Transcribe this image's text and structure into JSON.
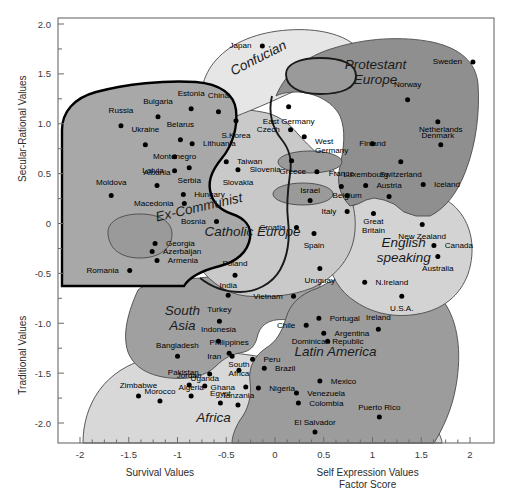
{
  "chart_data": {
    "type": "scatter",
    "title": "",
    "xlabel": "Survival Values / Self Expression Values Factor Score",
    "ylabel": "Traditional Values / Secular-Rational Values",
    "xlim": [
      -2.2,
      2.2
    ],
    "ylim": [
      -2.25,
      2.0
    ],
    "grid": false,
    "legend": "none",
    "axes": {
      "y_top_title": "Secular-Rational Values",
      "y_bottom_title": "Traditional Values",
      "x_left_title": "Survival Values",
      "x_right_title_line1": "Self Expression Values",
      "x_right_title_line2": "Factor Score",
      "x_ticks": [
        "-2",
        "-1.5",
        "-1",
        "-0.5",
        "0",
        "0.5",
        "1",
        "1.5",
        "2"
      ],
      "x_tick_values": [
        -2,
        -1.5,
        -1,
        -0.5,
        0,
        0.5,
        1,
        1.5,
        2
      ],
      "y_ticks": [
        "2.0",
        "1.5",
        "1.0",
        "0.5",
        "0",
        "-0.5",
        "-1.0",
        "-1.5",
        "-2.0"
      ],
      "y_tick_values": [
        2.0,
        1.5,
        1.0,
        0.5,
        0,
        -0.5,
        -1.0,
        -1.5,
        -2.0
      ]
    },
    "zone_labels": [
      {
        "name": "Confucian",
        "x": -0.15,
        "y": 1.62,
        "rotate": -27,
        "size": "lg"
      },
      {
        "name": "Protestant Europe",
        "x": 1.03,
        "y": 1.55,
        "size": "lg",
        "two_line": true
      },
      {
        "name": "Ex-Communist",
        "x": -0.77,
        "y": 0.12,
        "rotate": -13,
        "size": "lg"
      },
      {
        "name": "Catholic Europe",
        "x": -0.23,
        "y": -0.13,
        "size": "lg"
      },
      {
        "name": "English speaking",
        "x": 1.32,
        "y": -0.24,
        "size": "lg",
        "two_line": true
      },
      {
        "name": "South Asia",
        "x": -0.95,
        "y": -0.92,
        "size": "lg",
        "two_line": true
      },
      {
        "name": "Latin America",
        "x": 0.62,
        "y": -1.33,
        "size": "lg"
      },
      {
        "name": "Africa",
        "x": -0.63,
        "y": -1.99,
        "size": "lg"
      }
    ],
    "points": [
      {
        "label": "Japan",
        "x": -0.13,
        "y": 1.78,
        "lx": -0.2,
        "ly": 1.78,
        "anchor": "end"
      },
      {
        "label": "Sweden",
        "x": 2.03,
        "y": 1.62,
        "lx": 1.96,
        "ly": 1.62,
        "anchor": "end"
      },
      {
        "label": "Estonia",
        "x": -0.86,
        "y": 1.15,
        "lx": -0.86,
        "ly": 1.3,
        "anchor": "middle"
      },
      {
        "label": "China",
        "x": -0.58,
        "y": 1.12,
        "lx": -0.58,
        "ly": 1.28,
        "anchor": "middle"
      },
      {
        "label": "Norway",
        "x": 1.36,
        "y": 1.24,
        "lx": 1.36,
        "ly": 1.39,
        "anchor": "middle"
      },
      {
        "label": "Bulgaria",
        "x": -1.2,
        "y": 1.07,
        "lx": -1.2,
        "ly": 1.22,
        "anchor": "middle"
      },
      {
        "label": "Russia",
        "x": -1.58,
        "y": 0.98,
        "lx": -1.58,
        "ly": 1.13,
        "anchor": "middle"
      },
      {
        "label": "S.Korea",
        "x": -0.4,
        "y": 1.03,
        "lx": -0.4,
        "ly": 0.88,
        "anchor": "middle"
      },
      {
        "label": "Denmark",
        "x": 1.67,
        "y": 1.02,
        "lx": 1.67,
        "ly": 0.88,
        "anchor": "middle"
      },
      {
        "label": "East Germany",
        "x": 0.14,
        "y": 1.17,
        "lx": 0.14,
        "ly": 1.02,
        "anchor": "middle"
      },
      {
        "label": "Czech",
        "x": 0.16,
        "y": 0.94,
        "lx": 0.09,
        "ly": 0.94,
        "anchor": "end"
      },
      {
        "label": "West Germany",
        "x": 0.3,
        "y": 0.87,
        "lx": 0.37,
        "ly": 0.82,
        "anchor": "start",
        "two_line": true
      },
      {
        "label": "Belarus",
        "x": -0.97,
        "y": 0.84,
        "lx": -0.97,
        "ly": 0.99,
        "anchor": "middle"
      },
      {
        "label": "Ukraine",
        "x": -1.33,
        "y": 0.79,
        "lx": -1.33,
        "ly": 0.94,
        "anchor": "middle"
      },
      {
        "label": "Lithuania",
        "x": -0.85,
        "y": 0.8,
        "lx": -0.78,
        "ly": 0.8,
        "anchor": "start"
      },
      {
        "label": "Netherlands",
        "x": 1.7,
        "y": 0.79,
        "lx": 1.7,
        "ly": 0.94,
        "anchor": "middle"
      },
      {
        "label": "Finland",
        "x": 1.0,
        "y": 0.8,
        "lx": 1.0,
        "ly": 0.8,
        "anchor": "middle"
      },
      {
        "label": "Montenegro",
        "x": -1.03,
        "y": 0.67,
        "lx": -1.03,
        "ly": 0.67,
        "anchor": "middle"
      },
      {
        "label": "Taiwan",
        "x": -0.5,
        "y": 0.62,
        "lx": -0.43,
        "ly": 0.62,
        "anchor": "start"
      },
      {
        "label": "Slovenia",
        "x": 0.17,
        "y": 0.63,
        "lx": 0.1,
        "ly": 0.54,
        "anchor": "end"
      },
      {
        "label": "Switzerland",
        "x": 1.29,
        "y": 0.62,
        "lx": 1.29,
        "ly": 0.49,
        "anchor": "middle"
      },
      {
        "label": "Latvia",
        "x": -1.03,
        "y": 0.53,
        "lx": -1.1,
        "ly": 0.53,
        "anchor": "end"
      },
      {
        "label": "Serbia",
        "x": -0.88,
        "y": 0.56,
        "lx": -0.88,
        "ly": 0.43,
        "anchor": "middle"
      },
      {
        "label": "Slovakia",
        "x": -0.38,
        "y": 0.54,
        "lx": -0.38,
        "ly": 0.41,
        "anchor": "middle"
      },
      {
        "label": "Greece",
        "x": 0.43,
        "y": 0.52,
        "lx": 0.36,
        "ly": 0.52,
        "anchor": "end"
      },
      {
        "label": "Iceland",
        "x": 1.52,
        "y": 0.39,
        "lx": 1.59,
        "ly": 0.39,
        "anchor": "start"
      },
      {
        "label": "Albania",
        "x": -1.21,
        "y": 0.38,
        "lx": -1.21,
        "ly": 0.51,
        "anchor": "middle"
      },
      {
        "label": "Luxembourg",
        "x": 0.93,
        "y": 0.38,
        "lx": 0.93,
        "ly": 0.49,
        "anchor": "middle"
      },
      {
        "label": "France",
        "x": 0.68,
        "y": 0.37,
        "lx": 0.68,
        "ly": 0.5,
        "anchor": "middle"
      },
      {
        "label": "Austria",
        "x": 1.17,
        "y": 0.27,
        "lx": 1.17,
        "ly": 0.38,
        "anchor": "middle"
      },
      {
        "label": "Moldova",
        "x": -1.68,
        "y": 0.28,
        "lx": -1.68,
        "ly": 0.41,
        "anchor": "middle"
      },
      {
        "label": "Hungary",
        "x": -0.94,
        "y": 0.29,
        "lx": -0.87,
        "ly": 0.29,
        "anchor": "start"
      },
      {
        "label": "Belgium",
        "x": 0.74,
        "y": 0.28,
        "lx": 0.74,
        "ly": 0.28,
        "anchor": "middle"
      },
      {
        "label": "Israel",
        "x": 0.36,
        "y": 0.23,
        "lx": 0.36,
        "ly": 0.33,
        "anchor": "middle"
      },
      {
        "label": "Macedonia",
        "x": -0.93,
        "y": 0.2,
        "lx": -1.0,
        "ly": 0.2,
        "anchor": "end"
      },
      {
        "label": "Italy",
        "x": 0.74,
        "y": 0.12,
        "lx": 0.67,
        "ly": 0.12,
        "anchor": "end"
      },
      {
        "label": "Great Britain",
        "x": 1.01,
        "y": 0.1,
        "lx": 1.01,
        "ly": 0.02,
        "anchor": "middle",
        "two_line": true
      },
      {
        "label": "Bosnia",
        "x": -0.6,
        "y": 0.02,
        "lx": -0.67,
        "ly": 0.02,
        "anchor": "end"
      },
      {
        "label": "Croatia",
        "x": 0.22,
        "y": -0.04,
        "lx": 0.15,
        "ly": -0.04,
        "anchor": "end"
      },
      {
        "label": "New Zealand",
        "x": 1.51,
        "y": -0.01,
        "lx": 1.51,
        "ly": -0.13,
        "anchor": "middle"
      },
      {
        "label": "Spain",
        "x": 0.4,
        "y": -0.1,
        "lx": 0.4,
        "ly": -0.22,
        "anchor": "middle"
      },
      {
        "label": "Georgia",
        "x": -1.23,
        "y": -0.2,
        "lx": -1.16,
        "ly": -0.2,
        "anchor": "start"
      },
      {
        "label": "Canada",
        "x": 1.63,
        "y": -0.22,
        "lx": 1.7,
        "ly": -0.22,
        "anchor": "start"
      },
      {
        "label": "Azerbaijan",
        "x": -1.26,
        "y": -0.28,
        "lx": -1.19,
        "ly": -0.28,
        "anchor": "start"
      },
      {
        "label": "Australia",
        "x": 1.67,
        "y": -0.33,
        "lx": 1.67,
        "ly": -0.45,
        "anchor": "middle"
      },
      {
        "label": "Armenia",
        "x": -1.21,
        "y": -0.37,
        "lx": -1.14,
        "ly": -0.37,
        "anchor": "start"
      },
      {
        "label": "Uruguay",
        "x": 0.46,
        "y": -0.45,
        "lx": 0.46,
        "ly": -0.57,
        "anchor": "middle"
      },
      {
        "label": "Romania",
        "x": -1.49,
        "y": -0.47,
        "lx": -1.56,
        "ly": -0.47,
        "anchor": "end"
      },
      {
        "label": "N.Ireland",
        "x": 0.92,
        "y": -0.59,
        "lx": 0.99,
        "ly": -0.59,
        "anchor": "start"
      },
      {
        "label": "Poland",
        "x": -0.41,
        "y": -0.52,
        "lx": -0.41,
        "ly": -0.4,
        "anchor": "middle"
      },
      {
        "label": "India",
        "x": -0.48,
        "y": -0.72,
        "lx": -0.48,
        "ly": -0.62,
        "anchor": "middle"
      },
      {
        "label": "Vietnam",
        "x": 0.19,
        "y": -0.73,
        "lx": 0.12,
        "ly": -0.73,
        "anchor": "end"
      },
      {
        "label": "U.S.A.",
        "x": 1.3,
        "y": -0.73,
        "lx": 1.3,
        "ly": -0.85,
        "anchor": "middle"
      },
      {
        "label": "Turkey",
        "x": -0.57,
        "y": -0.98,
        "lx": -0.57,
        "ly": -0.86,
        "anchor": "middle"
      },
      {
        "label": "Portugal",
        "x": 0.45,
        "y": -0.95,
        "lx": 0.52,
        "ly": -0.95,
        "anchor": "start"
      },
      {
        "label": "Chile",
        "x": 0.32,
        "y": -1.02,
        "lx": 0.25,
        "ly": -1.02,
        "anchor": "end"
      },
      {
        "label": "Indonesia",
        "x": -0.58,
        "y": -1.18,
        "lx": -0.58,
        "ly": -1.06,
        "anchor": "middle"
      },
      {
        "label": "Argentina",
        "x": 0.5,
        "y": -1.1,
        "lx": 0.57,
        "ly": -1.1,
        "anchor": "start"
      },
      {
        "label": "Ireland",
        "x": 1.06,
        "y": -1.06,
        "lx": 1.06,
        "ly": -0.94,
        "anchor": "middle"
      },
      {
        "label": "Philippines",
        "x": -0.47,
        "y": -1.3,
        "lx": -0.47,
        "ly": -1.19,
        "anchor": "middle"
      },
      {
        "label": "Dominican Republic",
        "x": 0.54,
        "y": -1.18,
        "lx": 0.54,
        "ly": -1.18,
        "anchor": "middle"
      },
      {
        "label": "Iran",
        "x": -0.44,
        "y": -1.33,
        "lx": -0.51,
        "ly": -1.33,
        "anchor": "end"
      },
      {
        "label": "Bangladesh",
        "x": -1.0,
        "y": -1.33,
        "lx": -1.0,
        "ly": -1.22,
        "anchor": "middle"
      },
      {
        "label": "Peru",
        "x": -0.23,
        "y": -1.36,
        "lx": -0.16,
        "ly": -1.36,
        "anchor": "start"
      },
      {
        "label": "South Africa",
        "x": -0.37,
        "y": -1.47,
        "lx": -0.37,
        "ly": -1.41,
        "anchor": "middle",
        "two_line": true
      },
      {
        "label": "Brazil",
        "x": -0.11,
        "y": -1.45,
        "lx": -0.04,
        "ly": -1.45,
        "anchor": "start"
      },
      {
        "label": "Pakistan",
        "x": -0.67,
        "y": -1.51,
        "lx": -0.74,
        "ly": -1.49,
        "anchor": "end"
      },
      {
        "label": "Jordan",
        "x": -0.88,
        "y": -1.62,
        "lx": -0.88,
        "ly": -1.52,
        "anchor": "middle"
      },
      {
        "label": "Uganda",
        "x": -0.72,
        "y": -1.63,
        "lx": -0.72,
        "ly": -1.55,
        "anchor": "middle"
      },
      {
        "label": "Ghana",
        "x": -0.3,
        "y": -1.64,
        "lx": -0.37,
        "ly": -1.64,
        "anchor": "end"
      },
      {
        "label": "Nigeria",
        "x": -0.17,
        "y": -1.65,
        "lx": -0.1,
        "ly": -1.65,
        "anchor": "start"
      },
      {
        "label": "Mexico",
        "x": 0.46,
        "y": -1.58,
        "lx": 0.53,
        "ly": -1.58,
        "anchor": "start"
      },
      {
        "label": "Zimbabwe",
        "x": -1.4,
        "y": -1.73,
        "lx": -1.4,
        "ly": -1.62,
        "anchor": "middle"
      },
      {
        "label": "Algeria",
        "x": -0.86,
        "y": -1.73,
        "lx": -0.86,
        "ly": -1.64,
        "anchor": "middle"
      },
      {
        "label": "Venezuela",
        "x": 0.22,
        "y": -1.7,
        "lx": 0.29,
        "ly": -1.7,
        "anchor": "start"
      },
      {
        "label": "Morocco",
        "x": -1.18,
        "y": -1.78,
        "lx": -1.18,
        "ly": -1.68,
        "anchor": "middle"
      },
      {
        "label": "Egypt",
        "x": -0.56,
        "y": -1.8,
        "lx": -0.56,
        "ly": -1.7,
        "anchor": "middle"
      },
      {
        "label": "Tanzania",
        "x": -0.38,
        "y": -1.82,
        "lx": -0.38,
        "ly": -1.72,
        "anchor": "middle"
      },
      {
        "label": "Colombia",
        "x": 0.24,
        "y": -1.8,
        "lx": 0.31,
        "ly": -1.8,
        "anchor": "start"
      },
      {
        "label": "Puerto Rico",
        "x": 1.07,
        "y": -1.94,
        "lx": 1.07,
        "ly": -1.84,
        "anchor": "middle"
      },
      {
        "label": "El Salvador",
        "x": 0.41,
        "y": -2.09,
        "lx": 0.41,
        "ly": -1.99,
        "anchor": "middle"
      }
    ]
  },
  "colors": {
    "zone_ex_communist": "#a8a8a8",
    "zone_confucian": "#e6e6e6",
    "zone_protestant": "#8f8f8f",
    "zone_catholic": "#c9c9c9",
    "zone_english": "#d3d3d3",
    "zone_south_asia": "#a0a0a0",
    "zone_latin": "#9c9c9c",
    "zone_africa": "#d8d8d8",
    "zone_orthodox_ellipse": "#9a9a9a",
    "frame": "#6b6b6b",
    "point": "#000000",
    "text": "#000000"
  }
}
